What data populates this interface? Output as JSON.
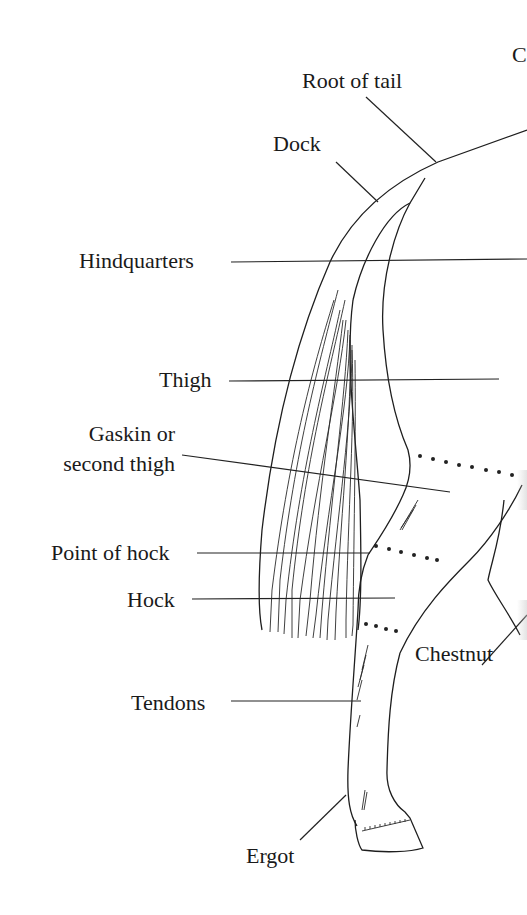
{
  "diagram": {
    "labels": {
      "root_of_tail": "Root of tail",
      "dock": "Dock",
      "hindquarters": "Hindquarters",
      "thigh": "Thigh",
      "gaskin": "Gaskin or\nsecond thigh",
      "point_of_hock": "Point of hock",
      "hock": "Hock",
      "tendons": "Tendons",
      "chestnut": "Chestnut",
      "ergot": "Ergot",
      "edge_fragment": "C"
    },
    "colors": {
      "ink": "#1e1e1e",
      "paper": "#ffffff"
    }
  }
}
